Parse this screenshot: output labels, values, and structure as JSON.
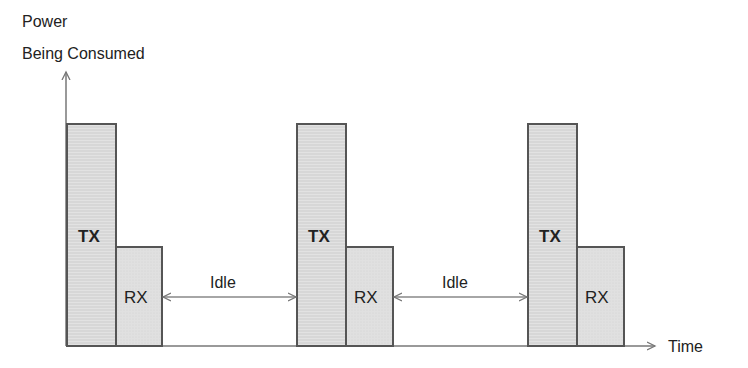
{
  "diagram": {
    "y_axis_label_line1": "Power",
    "y_axis_label_line2": "Being Consumed",
    "x_axis_label": "Time",
    "cycles": [
      {
        "tx_label": "TX",
        "rx_label": "RX"
      },
      {
        "tx_label": "TX",
        "rx_label": "RX"
      },
      {
        "tx_label": "TX",
        "rx_label": "RX"
      }
    ],
    "idle_labels": [
      "Idle",
      "Idle"
    ],
    "colors": {
      "bar_fill": "#dcdcdc",
      "stroke": "#555555",
      "axis": "#777777"
    }
  }
}
